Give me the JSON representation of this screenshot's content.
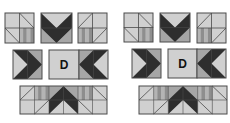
{
  "colors": {
    "light": "#d0d0d0",
    "mid": "#a6a6a6",
    "dark": "#2e2e2e",
    "stripe_a": "#b4b4b4",
    "stripe_b": "#8e8e8e",
    "line": "#4a4a4a",
    "background": "#ffffff"
  },
  "sets": [
    {
      "name": "set-left",
      "top_row": [
        {
          "name": "quarter-block-1",
          "x": 5,
          "y": 13,
          "w": 29,
          "h": 30,
          "type": "corner-a"
        },
        {
          "name": "chevron-down-block",
          "x": 41,
          "y": 13,
          "w": 31,
          "h": 30,
          "type": "chevron-down"
        },
        {
          "name": "quarter-block-2",
          "x": 78,
          "y": 13,
          "w": 29,
          "h": 30,
          "type": "corner-b"
        }
      ],
      "middle_row": [
        {
          "name": "arrow-right-block",
          "x": 13,
          "y": 50,
          "w": 29,
          "h": 29,
          "type": "arrow-right"
        },
        {
          "name": "label-block",
          "x": 49,
          "y": 50,
          "w": 30,
          "h": 29,
          "type": "label",
          "label": "D"
        },
        {
          "name": "arrow-left-block",
          "x": 79,
          "y": 50,
          "w": 29,
          "h": 29,
          "type": "arrow-left"
        }
      ],
      "bottom_row": {
        "name": "chevron-up-strip",
        "x": 20,
        "y": 86,
        "w": 87,
        "h": 28,
        "type": "chevron-up-strip"
      }
    },
    {
      "name": "set-right",
      "top_row": [
        {
          "name": "quarter-block-1",
          "x": 124,
          "y": 13,
          "w": 29,
          "h": 29,
          "type": "corner-a"
        },
        {
          "name": "chevron-down-block",
          "x": 160,
          "y": 13,
          "w": 30,
          "h": 29,
          "type": "chevron-down"
        },
        {
          "name": "quarter-block-2",
          "x": 197,
          "y": 13,
          "w": 29,
          "h": 30,
          "type": "corner-b"
        }
      ],
      "middle_row": [
        {
          "name": "arrow-right-block",
          "x": 132,
          "y": 49,
          "w": 29,
          "h": 29,
          "type": "arrow-right"
        },
        {
          "name": "label-block",
          "x": 168,
          "y": 49,
          "w": 29,
          "h": 29,
          "type": "label",
          "label": "D"
        },
        {
          "name": "arrow-left-block",
          "x": 197,
          "y": 49,
          "w": 29,
          "h": 29,
          "type": "arrow-left"
        }
      ],
      "bottom_row": {
        "name": "chevron-up-strip",
        "x": 139,
        "y": 86,
        "w": 88,
        "h": 28,
        "type": "chevron-up-strip"
      }
    }
  ]
}
